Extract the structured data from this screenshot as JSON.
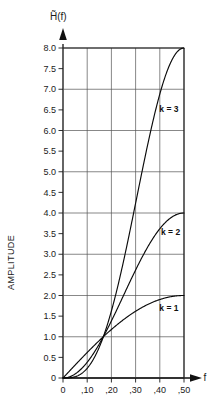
{
  "chart_data": {
    "type": "line",
    "title": "H̃(f)",
    "title_plain": "H~(f)",
    "xlabel": "f",
    "ylabel": "AMPLITUDE",
    "xlim": [
      0,
      0.5
    ],
    "ylim": [
      0,
      8.0
    ],
    "grid": true,
    "grid_x_values": [
      0,
      0.1,
      0.2,
      0.3,
      0.4,
      0.5
    ],
    "grid_y_values": [
      0,
      1.0,
      2.0,
      3.0,
      4.0,
      5.0,
      6.0,
      7.0,
      8.0
    ],
    "legend": "inline-annotations",
    "xticks": [
      0,
      0.1,
      0.2,
      0.3,
      0.4,
      0.5
    ],
    "xtick_labels": [
      "0",
      ",10",
      ",20",
      ",30",
      ",40",
      ",50"
    ],
    "yticks": [
      0,
      0.5,
      1.0,
      1.5,
      2.0,
      2.5,
      3.0,
      3.5,
      4.0,
      4.5,
      5.0,
      5.5,
      6.0,
      6.5,
      7.0,
      7.5,
      8.0
    ],
    "ytick_labels": [
      "0",
      "0.5",
      "1.0",
      "1.5",
      "2.0",
      "2.5",
      "3.0",
      "3.5",
      "4.0",
      "4.5",
      "5.0",
      "5.5",
      "6.0",
      "6.5",
      "7.0",
      "7.5",
      "8.0"
    ],
    "series": [
      {
        "name": "k = 1",
        "label": "k = 1",
        "formula": "(2 sin(pi f))^1",
        "x": [
          0.0,
          0.025,
          0.05,
          0.075,
          0.1,
          0.125,
          0.15,
          0.1667,
          0.175,
          0.2,
          0.225,
          0.25,
          0.275,
          0.3,
          0.325,
          0.35,
          0.375,
          0.4,
          0.425,
          0.45,
          0.475,
          0.5
        ],
        "y": [
          0.0,
          0.157,
          0.313,
          0.468,
          0.618,
          0.765,
          0.908,
          1.0,
          1.045,
          1.176,
          1.3,
          1.414,
          1.521,
          1.618,
          1.705,
          1.782,
          1.848,
          1.902,
          1.944,
          1.975,
          1.994,
          2.0
        ]
      },
      {
        "name": "k = 2",
        "label": "k = 2",
        "formula": "(2 sin(pi f))^2",
        "x": [
          0.0,
          0.025,
          0.05,
          0.075,
          0.1,
          0.125,
          0.15,
          0.1667,
          0.175,
          0.2,
          0.225,
          0.25,
          0.275,
          0.3,
          0.325,
          0.35,
          0.375,
          0.4,
          0.425,
          0.45,
          0.475,
          0.5
        ],
        "y": [
          0.0,
          0.0246,
          0.0979,
          0.219,
          0.382,
          0.586,
          0.824,
          1.0,
          1.092,
          1.382,
          1.69,
          2.0,
          2.314,
          2.618,
          2.906,
          3.175,
          3.414,
          3.618,
          3.78,
          3.9,
          3.976,
          4.0
        ]
      },
      {
        "name": "k = 3",
        "label": "k = 3",
        "formula": "(2 sin(pi f))^3",
        "x": [
          0.0,
          0.025,
          0.05,
          0.075,
          0.1,
          0.125,
          0.15,
          0.1667,
          0.175,
          0.2,
          0.225,
          0.25,
          0.275,
          0.3,
          0.325,
          0.35,
          0.375,
          0.4,
          0.425,
          0.45,
          0.475,
          0.5
        ],
        "y": [
          0.0,
          0.0039,
          0.0307,
          0.1026,
          0.236,
          0.448,
          0.748,
          1.0,
          1.141,
          1.626,
          2.197,
          2.828,
          3.52,
          4.236,
          4.954,
          5.657,
          6.31,
          6.882,
          7.35,
          7.703,
          7.929,
          8.0
        ]
      }
    ],
    "annotations": [
      {
        "text": "k = 3",
        "x": 0.398,
        "y": 6.45
      },
      {
        "text": "k = 2",
        "x": 0.405,
        "y": 3.46
      },
      {
        "text": "k = 1",
        "x": 0.398,
        "y": 1.62
      }
    ],
    "crossing_point": {
      "x": 0.1667,
      "y": 1.0
    }
  },
  "colors": {
    "background": "#ffffff",
    "curve": "#0a0a0a",
    "grid": "#555555",
    "frame": "#1a1a1a",
    "text": "#1a1a1a"
  }
}
